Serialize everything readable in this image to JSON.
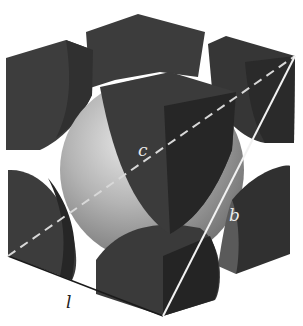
{
  "diagram": {
    "labels": {
      "c": "c",
      "b": "b",
      "l": "l"
    },
    "colors": {
      "background": "#ffffff",
      "corner_atom_face": "#3a3a3a",
      "corner_atom_dark": "#262626",
      "center_atom_light": "#c8c8c8",
      "center_atom_mid": "#8e8e8e",
      "body_diagonal": "#d8d8d8",
      "face_diagonal": "#f2f2f2",
      "edge_line": "#1a1a1a"
    }
  }
}
